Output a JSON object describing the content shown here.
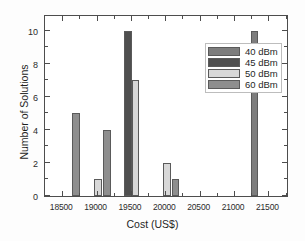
{
  "chart_data": {
    "type": "bar",
    "title": "",
    "xlabel": "Cost (US$)",
    "ylabel": "Number of Solutions",
    "xlim": [
      18250,
      21800
    ],
    "ylim": [
      0,
      11
    ],
    "xticks": [
      18500,
      19000,
      19500,
      20000,
      20500,
      21000,
      21500
    ],
    "xtick_labels": [
      "18500",
      "19000",
      "19500",
      "20000",
      "20500",
      "21000",
      "21500"
    ],
    "yticks": [
      0,
      2,
      4,
      6,
      8,
      10
    ],
    "ytick_labels": [
      "0",
      "2",
      "4",
      "6",
      "8",
      "10"
    ],
    "x_minor_ticks": [
      18750,
      19250,
      19750,
      20250,
      20750,
      21250,
      21750
    ],
    "y_minor_ticks": [
      1,
      3,
      5,
      7,
      9,
      11
    ],
    "grid": false,
    "legend_position": "upper center",
    "series": [
      {
        "name": "40 dBm",
        "color": "#7d7d7d",
        "points": [
          {
            "x": 21300,
            "value": 10,
            "width": 110
          }
        ]
      },
      {
        "name": "45 dBm",
        "color": "#4f4f4f",
        "points": [
          {
            "x": 19455,
            "value": 10,
            "width": 110
          }
        ]
      },
      {
        "name": "50 dBm",
        "color": "#d8d8d8",
        "points": [
          {
            "x": 19020,
            "value": 1,
            "width": 110
          },
          {
            "x": 19570,
            "value": 7,
            "width": 110
          },
          {
            "x": 20025,
            "value": 2,
            "width": 110
          },
          {
            "x": 19565,
            "value": 7,
            "width": 0
          }
        ]
      },
      {
        "name": "60 dBm",
        "color": "#8e8e8e",
        "points": [
          {
            "x": 18700,
            "value": 5,
            "width": 110
          },
          {
            "x": 19150,
            "value": 4,
            "width": 110
          },
          {
            "x": 20150,
            "value": 1,
            "width": 110
          }
        ]
      }
    ],
    "legend_entries": [
      {
        "label": "40 dBm",
        "color": "#7d7d7d"
      },
      {
        "label": "45 dBm",
        "color": "#4f4f4f"
      },
      {
        "label": "50 dBm",
        "color": "#d8d8d8"
      },
      {
        "label": "60 dBm",
        "color": "#8e8e8e"
      }
    ]
  }
}
